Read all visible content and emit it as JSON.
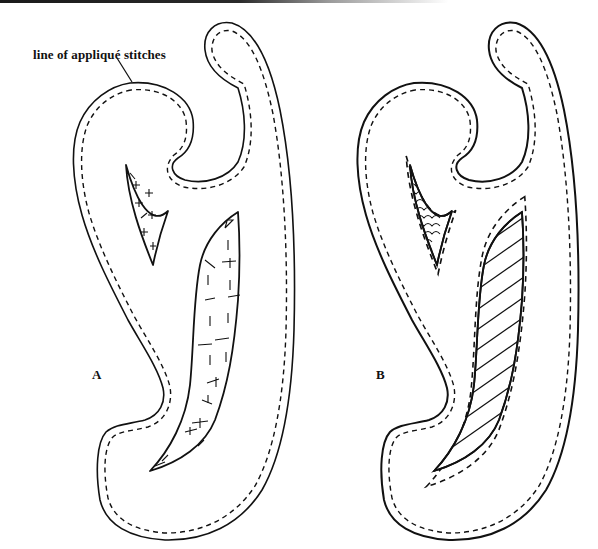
{
  "figure": {
    "callout_text": "line of appliqué stitches",
    "panels": [
      {
        "label": "A",
        "description": "appliqué shape with cut-out openings, raw edges turned and tacked with cross stitches"
      },
      {
        "label": "B",
        "description": "appliqué shape with reverse appliqué openings showing scale-pattern and striped fabric beneath"
      }
    ],
    "colors": {
      "ink": "#111111",
      "paper": "#ffffff"
    }
  }
}
